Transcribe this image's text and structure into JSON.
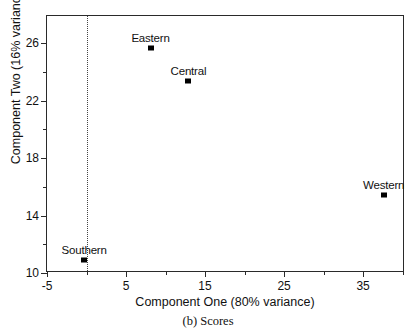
{
  "chart_data": {
    "type": "scatter",
    "title": "",
    "caption": "(b) Scores",
    "xlabel": "Component One (80% variance)",
    "ylabel": "Component Two (16% variance)",
    "xlim": [
      -5,
      40.3
    ],
    "ylim": [
      10,
      27.9
    ],
    "grid": false,
    "legend": null,
    "x_major_ticks": [
      -5,
      5,
      15,
      25,
      35
    ],
    "x_minor_ticks": [
      0,
      10,
      20,
      30,
      40
    ],
    "x_tick_labels": [
      "-5",
      "5",
      "15",
      "25",
      "35"
    ],
    "y_major_ticks": [
      10,
      14,
      18,
      22,
      26
    ],
    "y_minor_ticks": [
      12,
      16,
      20,
      24
    ],
    "y_tick_labels": [
      "10",
      "14",
      "18",
      "22",
      "26"
    ],
    "reference_line": {
      "axis": "x",
      "value": 0,
      "style": "dotted"
    },
    "points": [
      {
        "label": "Eastern",
        "x": 8.1,
        "y": 25.7
      },
      {
        "label": "Central",
        "x": 12.9,
        "y": 23.4
      },
      {
        "label": "Western",
        "x": 37.6,
        "y": 15.4
      },
      {
        "label": "Southern",
        "x": -0.3,
        "y": 10.9
      }
    ],
    "colors": {
      "marker": "#000000",
      "frame": "#2a2a2a",
      "reference_line": "#444444"
    }
  }
}
